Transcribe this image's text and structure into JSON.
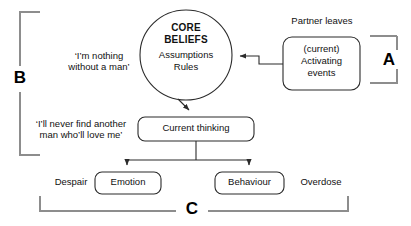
{
  "diagram": {
    "colors": {
      "stroke": "#2b2b2b",
      "bracket": "#888888",
      "text": "#111111",
      "background": "#ffffff"
    },
    "central_node": {
      "name": "core-beliefs-circle",
      "title_line1": "CORE",
      "title_line2": "BELIEFS",
      "sub_line1": "Assumptions",
      "sub_line2": "Rules"
    },
    "boxes": [
      {
        "id": "activating-events",
        "line1": "(current)",
        "line2": "Activating",
        "line3": "events"
      },
      {
        "id": "current-thinking",
        "label": "Current thinking"
      },
      {
        "id": "emotion",
        "label": "Emotion"
      },
      {
        "id": "behaviour",
        "label": "Behaviour"
      }
    ],
    "free_labels": {
      "partner_leaves": "Partner leaves",
      "belief_quote_line1": "‘I’m nothing",
      "belief_quote_line2": "without a man’",
      "thinking_quote_line1": "‘I’ll never find another",
      "thinking_quote_line2": "man who’ll love me’",
      "despair": "Despair",
      "overdose": "Overdose"
    },
    "brackets": [
      {
        "id": "bracket-a",
        "letter": "A"
      },
      {
        "id": "bracket-b",
        "letter": "B"
      },
      {
        "id": "bracket-c",
        "letter": "C"
      }
    ]
  }
}
